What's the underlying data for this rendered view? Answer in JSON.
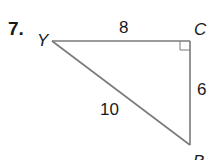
{
  "problem": {
    "number": "7."
  },
  "triangle": {
    "vertices": {
      "Y": {
        "label": "Y",
        "x": 52,
        "y": 41
      },
      "C": {
        "label": "C",
        "x": 190,
        "y": 41
      },
      "B": {
        "label": "B",
        "x": 190,
        "y": 145
      }
    },
    "sides": {
      "YC": {
        "label": "8"
      },
      "CB": {
        "label": "6"
      },
      "YB": {
        "label": "10"
      }
    },
    "right_angle_at": "C"
  },
  "colors": {
    "line": "#7a7a7a",
    "text": "#1a1a1a",
    "background": "#ffffff"
  }
}
